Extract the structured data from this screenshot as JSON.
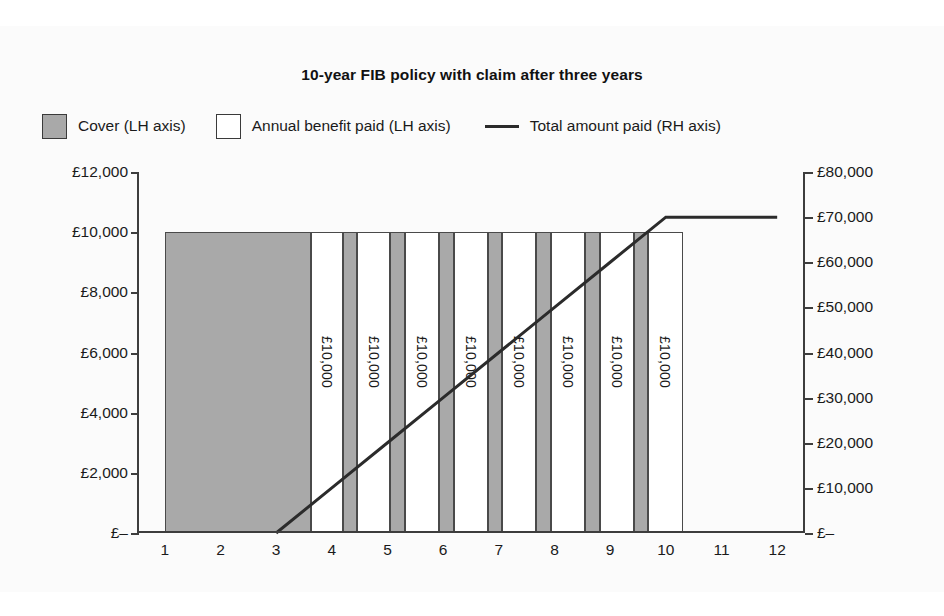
{
  "chart_data": {
    "type": "bar",
    "title": "10-year FIB policy with claim after three years",
    "xlabel": "",
    "ylabel": "",
    "grid": false,
    "legend_position": "top",
    "categories": [
      "1",
      "2",
      "3",
      "4",
      "5",
      "6",
      "7",
      "8",
      "9",
      "10",
      "11",
      "12"
    ],
    "left_axis": {
      "label": "LH axis",
      "ylim": [
        0,
        12000
      ],
      "ticks": [
        0,
        2000,
        4000,
        6000,
        8000,
        10000,
        12000
      ],
      "tick_labels": [
        "£–",
        "£2,000",
        "£4,000",
        "£6,000",
        "£8,000",
        "£10,000",
        "£12,000"
      ]
    },
    "right_axis": {
      "label": "RH axis",
      "ylim": [
        0,
        80000
      ],
      "ticks": [
        0,
        10000,
        20000,
        30000,
        40000,
        50000,
        60000,
        70000,
        80000
      ],
      "tick_labels": [
        "£–",
        "£10,000",
        "£20,000",
        "£30,000",
        "£40,000",
        "£50,000",
        "£60,000",
        "£70,000",
        "£80,000"
      ]
    },
    "series": [
      {
        "name": "Cover (LH axis)",
        "kind": "bar",
        "axis": "left",
        "color": "#a9a9a9",
        "values": [
          10000,
          10000,
          10000,
          10000,
          10000,
          10000,
          10000,
          10000,
          10000,
          10000,
          0,
          0
        ]
      },
      {
        "name": "Annual benefit paid (LH axis)",
        "kind": "bar",
        "axis": "left",
        "color": "#ffffff",
        "values": [
          0,
          0,
          0,
          10000,
          10000,
          10000,
          10000,
          10000,
          10000,
          10000,
          0,
          0
        ],
        "data_labels": [
          "",
          "",
          "",
          "£10,000",
          "£10,000",
          "£10,000",
          "£10,000",
          "£10,000",
          "£10,000",
          "£10,000",
          "",
          ""
        ]
      },
      {
        "name": "Total amount paid (RH axis)",
        "kind": "line",
        "axis": "right",
        "color": "#2b2b2b",
        "x": [
          3,
          4,
          5,
          6,
          7,
          8,
          9,
          10,
          11,
          12
        ],
        "values": [
          0,
          10000,
          20000,
          30000,
          40000,
          50000,
          60000,
          70000,
          70000,
          70000
        ]
      }
    ],
    "bands": [
      {
        "series": "cover",
        "start_year": 1.0,
        "end_year": 3.62,
        "value": 10000,
        "label": ""
      },
      {
        "series": "benefit",
        "start_year": 3.62,
        "end_year": 4.2,
        "value": 10000,
        "label": "£10,000"
      },
      {
        "series": "cover",
        "start_year": 4.2,
        "end_year": 4.46,
        "value": 10000,
        "label": ""
      },
      {
        "series": "benefit",
        "start_year": 4.46,
        "end_year": 5.05,
        "value": 10000,
        "label": "£10,000"
      },
      {
        "series": "cover",
        "start_year": 5.05,
        "end_year": 5.31,
        "value": 10000,
        "label": ""
      },
      {
        "series": "benefit",
        "start_year": 5.31,
        "end_year": 5.92,
        "value": 10000,
        "label": "£10,000"
      },
      {
        "series": "cover",
        "start_year": 5.92,
        "end_year": 6.19,
        "value": 10000,
        "label": ""
      },
      {
        "series": "benefit",
        "start_year": 6.19,
        "end_year": 6.8,
        "value": 10000,
        "label": "£10,000"
      },
      {
        "series": "cover",
        "start_year": 6.8,
        "end_year": 7.06,
        "value": 10000,
        "label": ""
      },
      {
        "series": "benefit",
        "start_year": 7.06,
        "end_year": 7.67,
        "value": 10000,
        "label": "£10,000"
      },
      {
        "series": "cover",
        "start_year": 7.67,
        "end_year": 7.94,
        "value": 10000,
        "label": ""
      },
      {
        "series": "benefit",
        "start_year": 7.94,
        "end_year": 8.55,
        "value": 10000,
        "label": "£10,000"
      },
      {
        "series": "cover",
        "start_year": 8.55,
        "end_year": 8.81,
        "value": 10000,
        "label": ""
      },
      {
        "series": "benefit",
        "start_year": 8.81,
        "end_year": 9.42,
        "value": 10000,
        "label": "£10,000"
      },
      {
        "series": "cover",
        "start_year": 9.42,
        "end_year": 9.68,
        "value": 10000,
        "label": ""
      },
      {
        "series": "benefit",
        "start_year": 9.68,
        "end_year": 10.3,
        "value": 10000,
        "label": "£10,000"
      }
    ]
  },
  "legend": {
    "cover": "Cover (LH axis)",
    "benefit": "Annual benefit paid (LH axis)",
    "total": "Total amount paid (RH axis)"
  },
  "colors": {
    "cover_fill": "#a9a9a9",
    "benefit_fill": "#ffffff",
    "line": "#2b2b2b",
    "axis": "#3d3d3d",
    "text": "#1a1a1a",
    "background": "#fbfbfb"
  }
}
